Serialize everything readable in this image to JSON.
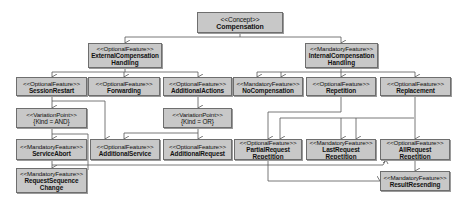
{
  "diagram": {
    "type": "feature-model",
    "colors": {
      "node_fill": "#c8c8c8",
      "node_border": "#6e6e6e",
      "edge": "#555555",
      "background": "#ffffff"
    },
    "nodes": [
      {
        "id": "compensation",
        "stereotype": "<<Concept>>",
        "name": "Compensation",
        "name2": ""
      },
      {
        "id": "external",
        "stereotype": "<<OptionalFeature>>",
        "name": "ExternalCompensation",
        "name2": "Handling"
      },
      {
        "id": "internal",
        "stereotype": "<<MandatoryFeature>>",
        "name": "InternalCompensation",
        "name2": "Handling"
      },
      {
        "id": "sessionrestart",
        "stereotype": "<<OptionalFeature>>",
        "name": "SessionRestart",
        "name2": ""
      },
      {
        "id": "forwarding",
        "stereotype": "<<OptionalFeature>>",
        "name": "Forwarding",
        "name2": ""
      },
      {
        "id": "additionalactions",
        "stereotype": "<<OptionalFeature>>",
        "name": "AdditionalActions",
        "name2": ""
      },
      {
        "id": "nocompensation",
        "stereotype": "<<MandatoryFeature>>",
        "name": "NoCompensation",
        "name2": ""
      },
      {
        "id": "repetition",
        "stereotype": "<<OptionalFeature>>",
        "name": "Repetition",
        "name2": ""
      },
      {
        "id": "replacement",
        "stereotype": "<<OptionalFeature>>",
        "name": "Replacement",
        "name2": ""
      },
      {
        "id": "vp_and",
        "stereotype": "<<VariationPoint>>",
        "name": "{Kind = AND}",
        "name2": ""
      },
      {
        "id": "vp_or",
        "stereotype": "<<VariationPoint>>",
        "name": "{Kind = OR}",
        "name2": ""
      },
      {
        "id": "serviceabort",
        "stereotype": "<<MandatoryFeature>>",
        "name": "ServiceAbort",
        "name2": ""
      },
      {
        "id": "additionalservice",
        "stereotype": "<<OptionalFeature>>",
        "name": "AdditionalService",
        "name2": ""
      },
      {
        "id": "additionalrequest",
        "stereotype": "<<OptionalFeature>>",
        "name": "AdditionalRequest",
        "name2": ""
      },
      {
        "id": "partialrequest",
        "stereotype": "<<OptionalFeature>>",
        "name": "PartialRequest",
        "name2": "Repetition"
      },
      {
        "id": "lastrequest",
        "stereotype": "<<MandatoryFeature>>",
        "name": "LastRequest",
        "name2": "Repetition"
      },
      {
        "id": "allrequest",
        "stereotype": "<<OptionalFeature>>",
        "name": "AllRequest",
        "name2": "Repetition"
      },
      {
        "id": "requestsequence",
        "stereotype": "<<MandatoryFeature>>",
        "name": "RequestSequence",
        "name2": "Change"
      },
      {
        "id": "resultresending",
        "stereotype": "<<MandatoryFeature>>",
        "name": "ResultResending",
        "name2": ""
      }
    ]
  }
}
